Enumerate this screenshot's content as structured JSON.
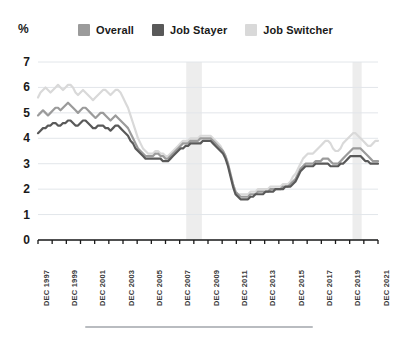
{
  "axis": {
    "unit_label": "%",
    "y_ticks": [
      "7",
      "6",
      "5",
      "4",
      "3",
      "2",
      "1",
      "0"
    ],
    "x_ticks": [
      "DEC 1997",
      "DEC 1999",
      "DEC 2001",
      "DEC 2003",
      "DEC 2005",
      "DEC 2007",
      "DEC 2009",
      "DEC 2011",
      "DEC 2013",
      "DEC 2015",
      "DEC 2017",
      "DEC 2019",
      "DEC 2021"
    ]
  },
  "legend": {
    "items": [
      {
        "label": "Overall",
        "color": "#9b9b9b"
      },
      {
        "label": "Job Stayer",
        "color": "#595959"
      },
      {
        "label": "Job Switcher",
        "color": "#d9d9d9"
      }
    ]
  },
  "colors": {
    "overall": "#9b9b9b",
    "job_stayer": "#595959",
    "job_switcher": "#d9d9d9",
    "gridline": "#e2e6ea",
    "axis": "#1a1a1a",
    "recession_band": "#ededed",
    "rule": "#b9bcc0"
  },
  "chart_data": {
    "type": "line",
    "title": "",
    "subtitle": "",
    "xlabel": "",
    "ylabel": "%",
    "ylim": [
      0,
      7
    ],
    "grid": true,
    "legend_position": "top",
    "x_start": "DEC 1997",
    "x_end": "DEC 2021",
    "x_step_years": 2,
    "annotations": [
      {
        "type": "recession-band",
        "label": "2008-2009 recession",
        "x_from": "MAR 2008",
        "x_to": "JUN 2009"
      },
      {
        "type": "recession-band",
        "label": "2020 recession",
        "x_from": "FEB 2020",
        "x_to": "AUG 2020"
      }
    ],
    "series": [
      {
        "name": "Overall",
        "color": "#9b9b9b",
        "values": [
          4.9,
          5.0,
          5.1,
          5.0,
          4.9,
          5.0,
          5.1,
          5.2,
          5.2,
          5.1,
          5.2,
          5.3,
          5.4,
          5.3,
          5.2,
          5.1,
          5.0,
          5.1,
          5.2,
          5.2,
          5.1,
          5.0,
          4.9,
          4.8,
          4.9,
          5.0,
          5.0,
          4.9,
          4.8,
          4.7,
          4.8,
          4.9,
          4.8,
          4.7,
          4.6,
          4.5,
          4.4,
          4.2,
          4.0,
          3.8,
          3.6,
          3.5,
          3.4,
          3.3,
          3.3,
          3.3,
          3.3,
          3.4,
          3.4,
          3.3,
          3.3,
          3.2,
          3.2,
          3.3,
          3.4,
          3.5,
          3.6,
          3.7,
          3.8,
          3.8,
          3.8,
          3.9,
          3.9,
          3.9,
          3.9,
          4.0,
          4.0,
          4.0,
          4.0,
          4.0,
          3.9,
          3.8,
          3.7,
          3.6,
          3.5,
          3.3,
          3.0,
          2.6,
          2.2,
          1.9,
          1.8,
          1.7,
          1.7,
          1.7,
          1.7,
          1.8,
          1.8,
          1.8,
          1.9,
          1.9,
          1.9,
          1.9,
          1.9,
          2.0,
          2.0,
          2.0,
          2.0,
          2.0,
          2.1,
          2.1,
          2.1,
          2.2,
          2.3,
          2.4,
          2.6,
          2.8,
          2.9,
          3.0,
          3.0,
          3.0,
          3.0,
          3.1,
          3.1,
          3.1,
          3.2,
          3.2,
          3.2,
          3.1,
          3.0,
          3.0,
          3.0,
          3.1,
          3.2,
          3.3,
          3.4,
          3.5,
          3.6,
          3.6,
          3.6,
          3.6,
          3.5,
          3.4,
          3.3,
          3.2,
          3.1,
          3.1,
          3.1
        ],
        "first_value": 4.9,
        "last_value": 3.1,
        "min": 1.7,
        "max": 5.4
      },
      {
        "name": "Job Stayer",
        "color": "#595959",
        "values": [
          4.2,
          4.3,
          4.4,
          4.4,
          4.5,
          4.5,
          4.6,
          4.6,
          4.5,
          4.5,
          4.6,
          4.6,
          4.7,
          4.7,
          4.6,
          4.5,
          4.5,
          4.6,
          4.7,
          4.7,
          4.6,
          4.5,
          4.4,
          4.4,
          4.5,
          4.5,
          4.5,
          4.4,
          4.4,
          4.3,
          4.4,
          4.5,
          4.5,
          4.4,
          4.3,
          4.2,
          4.1,
          3.9,
          3.8,
          3.6,
          3.5,
          3.4,
          3.3,
          3.2,
          3.2,
          3.2,
          3.2,
          3.2,
          3.2,
          3.2,
          3.1,
          3.1,
          3.1,
          3.2,
          3.3,
          3.4,
          3.5,
          3.6,
          3.6,
          3.7,
          3.7,
          3.8,
          3.8,
          3.8,
          3.8,
          3.8,
          3.9,
          3.9,
          3.9,
          3.9,
          3.8,
          3.7,
          3.6,
          3.5,
          3.4,
          3.2,
          2.9,
          2.5,
          2.1,
          1.8,
          1.7,
          1.6,
          1.6,
          1.6,
          1.6,
          1.7,
          1.7,
          1.8,
          1.8,
          1.8,
          1.8,
          1.9,
          1.9,
          1.9,
          1.9,
          2.0,
          2.0,
          2.0,
          2.0,
          2.1,
          2.1,
          2.1,
          2.2,
          2.3,
          2.5,
          2.7,
          2.8,
          2.9,
          2.9,
          2.9,
          2.9,
          3.0,
          3.0,
          3.0,
          3.0,
          3.0,
          3.0,
          2.9,
          2.9,
          2.9,
          2.9,
          3.0,
          3.0,
          3.1,
          3.2,
          3.3,
          3.3,
          3.3,
          3.3,
          3.3,
          3.2,
          3.1,
          3.1,
          3.0,
          3.0,
          3.0,
          3.0
        ],
        "first_value": 4.2,
        "last_value": 3.0,
        "min": 1.6,
        "max": 4.7
      },
      {
        "name": "Job Switcher",
        "color": "#d9d9d9",
        "values": [
          5.6,
          5.8,
          5.9,
          6.0,
          5.9,
          5.8,
          5.9,
          6.0,
          6.1,
          6.0,
          5.9,
          6.0,
          6.1,
          6.1,
          6.0,
          5.8,
          5.7,
          5.8,
          5.9,
          5.8,
          5.7,
          5.6,
          5.5,
          5.6,
          5.7,
          5.8,
          5.9,
          5.9,
          5.8,
          5.7,
          5.8,
          5.9,
          5.9,
          5.8,
          5.6,
          5.4,
          5.2,
          4.9,
          4.6,
          4.3,
          4.0,
          3.8,
          3.6,
          3.5,
          3.4,
          3.4,
          3.4,
          3.5,
          3.5,
          3.4,
          3.4,
          3.3,
          3.3,
          3.4,
          3.5,
          3.6,
          3.7,
          3.8,
          3.9,
          3.9,
          3.9,
          4.0,
          4.0,
          4.0,
          4.0,
          4.1,
          4.1,
          4.1,
          4.1,
          4.1,
          4.0,
          3.9,
          3.8,
          3.7,
          3.5,
          3.3,
          3.0,
          2.6,
          2.2,
          1.9,
          1.8,
          1.8,
          1.8,
          1.8,
          1.8,
          1.9,
          1.9,
          1.9,
          2.0,
          2.0,
          2.0,
          2.0,
          2.0,
          2.1,
          2.1,
          2.1,
          2.1,
          2.1,
          2.2,
          2.2,
          2.2,
          2.3,
          2.5,
          2.6,
          2.8,
          3.0,
          3.2,
          3.3,
          3.4,
          3.4,
          3.4,
          3.5,
          3.6,
          3.7,
          3.8,
          3.9,
          3.9,
          3.8,
          3.6,
          3.5,
          3.5,
          3.6,
          3.8,
          3.9,
          4.0,
          4.1,
          4.2,
          4.2,
          4.1,
          4.0,
          3.9,
          3.8,
          3.7,
          3.7,
          3.8,
          3.9,
          3.9
        ],
        "first_value": 5.6,
        "last_value": 3.9,
        "min": 1.8,
        "max": 6.1
      }
    ]
  }
}
